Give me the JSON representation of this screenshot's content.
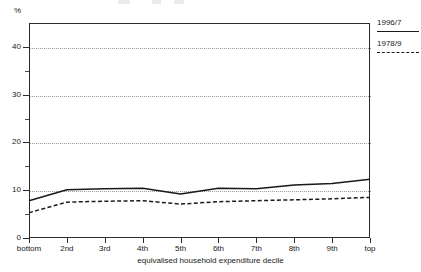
{
  "chart_data": {
    "type": "line",
    "title": "",
    "xlabel": "equivalised household expenditure decile",
    "ylabel": "",
    "yunit": "%",
    "ylim": [
      0,
      45
    ],
    "yticks": [
      0,
      10,
      20,
      30,
      40
    ],
    "grid": true,
    "legend_position": "right",
    "categories": [
      "bottom",
      "2nd",
      "3rd",
      "4th",
      "5th",
      "6th",
      "7th",
      "8th",
      "9th",
      "top"
    ],
    "series": [
      {
        "name": "1996/7",
        "style": "solid",
        "color": "#1a1a1a",
        "values": [
          7.8,
          10.1,
          10.3,
          10.4,
          9.2,
          10.4,
          10.3,
          11.1,
          11.4,
          12.3
        ]
      },
      {
        "name": "1978/9",
        "style": "dashed",
        "color": "#1a1a1a",
        "values": [
          5.3,
          7.5,
          7.7,
          7.8,
          7.1,
          7.6,
          7.8,
          8.0,
          8.2,
          8.5
        ]
      }
    ]
  },
  "axis": {
    "y_unit_label": "%",
    "y_tick_labels": [
      "0",
      "10",
      "20",
      "30",
      "40"
    ],
    "x_tick_labels": [
      "bottom",
      "2nd",
      "3rd",
      "4th",
      "5th",
      "6th",
      "7th",
      "8th",
      "9th",
      "top"
    ],
    "x_axis_title": "equivalised household expenditure decile"
  },
  "legend": {
    "entries": [
      {
        "label": "1996/7",
        "style": "solid"
      },
      {
        "label": "1978/9",
        "style": "dashed"
      }
    ]
  }
}
